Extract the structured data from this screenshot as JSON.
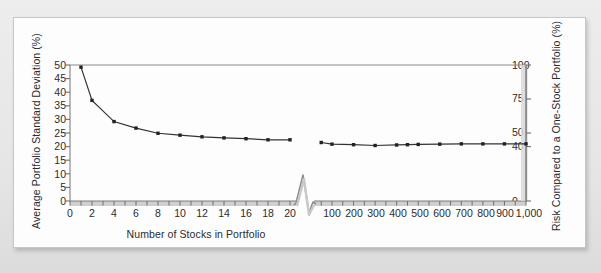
{
  "figure": {
    "kind": "scanned-textbook-figure",
    "background_color": "#eaeaea",
    "panel_color": "#fdfdfd"
  },
  "chart_data": {
    "type": "line",
    "title": "",
    "subtitle": "",
    "xlabel": "Number of Stocks in Portfolio",
    "ylabel": "Average Portfolio Standard Deviation (%)",
    "y2label": "Risk Compared to a One-Stock Portfolio (%)",
    "grid": false,
    "legend": false,
    "axis_break": {
      "present": true,
      "after_category": "20",
      "before_category": "100",
      "style": "zigzag"
    },
    "xlim_segment_1": [
      0,
      20
    ],
    "xlim_segment_2": [
      0,
      1000
    ],
    "ylim": [
      0,
      50
    ],
    "y2lim": [
      0,
      100
    ],
    "xticks_segment_1": [
      "0",
      "2",
      "4",
      "6",
      "8",
      "10",
      "12",
      "14",
      "16",
      "18",
      "20"
    ],
    "xticks_segment_2": [
      "100",
      "200",
      "300",
      "400",
      "500",
      "600",
      "700",
      "800",
      "900",
      "1,000"
    ],
    "yticks": [
      "0",
      "5",
      "10",
      "15",
      "20",
      "25",
      "30",
      "35",
      "40",
      "45",
      "50"
    ],
    "y2ticks": [
      "0",
      "40",
      "50",
      "75",
      "100"
    ],
    "series": [
      {
        "name": "Average portfolio standard deviation",
        "marker": "square",
        "color": "#333333",
        "segment_1": {
          "x": [
            1,
            2,
            4,
            6,
            8,
            10,
            12,
            14,
            16,
            18,
            20
          ],
          "y": [
            49.2,
            37.0,
            29.2,
            26.8,
            24.9,
            24.2,
            23.6,
            23.2,
            22.9,
            22.5,
            22.5
          ]
        },
        "segment_2": {
          "x": [
            50,
            100,
            200,
            300,
            400,
            450,
            500,
            600,
            700,
            800,
            900,
            1000
          ],
          "y": [
            21.5,
            20.9,
            20.7,
            20.4,
            20.6,
            20.7,
            20.8,
            20.9,
            21.0,
            21.0,
            21.0,
            21.0
          ]
        }
      }
    ],
    "annotations": [],
    "reading": {
      "one_stock_risk_percent": 100,
      "large_portfolio_risk_percent": 40
    }
  },
  "axis_labels": {
    "left_title": "Average Portfolio Standard Deviation (%)",
    "right_title": "Risk Compared to a One-Stock Portfolio (%)",
    "bottom_title": "Number of Stocks in Portfolio"
  },
  "y_ticks_left": [
    {
      "label": "50",
      "value": 50
    },
    {
      "label": "45",
      "value": 45
    },
    {
      "label": "40",
      "value": 40
    },
    {
      "label": "35",
      "value": 35
    },
    {
      "label": "30",
      "value": 30
    },
    {
      "label": "25",
      "value": 25
    },
    {
      "label": "20",
      "value": 20
    },
    {
      "label": "15",
      "value": 15
    },
    {
      "label": "10",
      "value": 10
    },
    {
      "label": "5",
      "value": 5
    },
    {
      "label": "0",
      "value": 0
    }
  ],
  "y_ticks_right": [
    {
      "label": "100",
      "value": 100
    },
    {
      "label": "75",
      "value": 75
    },
    {
      "label": "50",
      "value": 50
    },
    {
      "label": "40",
      "value": 40
    },
    {
      "label": "0",
      "value": 0
    }
  ],
  "x_ticks_left": [
    {
      "label": "0",
      "value": 0
    },
    {
      "label": "2",
      "value": 2
    },
    {
      "label": "4",
      "value": 4
    },
    {
      "label": "6",
      "value": 6
    },
    {
      "label": "8",
      "value": 8
    },
    {
      "label": "10",
      "value": 10
    },
    {
      "label": "12",
      "value": 12
    },
    {
      "label": "14",
      "value": 14
    },
    {
      "label": "16",
      "value": 16
    },
    {
      "label": "18",
      "value": 18
    },
    {
      "label": "20",
      "value": 20
    }
  ],
  "x_ticks_right": [
    {
      "label": "100",
      "value": 100
    },
    {
      "label": "200",
      "value": 200
    },
    {
      "label": "300",
      "value": 300
    },
    {
      "label": "400",
      "value": 400
    },
    {
      "label": "500",
      "value": 500
    },
    {
      "label": "600",
      "value": 600
    },
    {
      "label": "700",
      "value": 700
    },
    {
      "label": "800",
      "value": 800
    },
    {
      "label": "900",
      "value": 900
    },
    {
      "label": "1,000",
      "value": 1000
    }
  ],
  "colors": {
    "line": "#3a3a3a",
    "marker": "#222222",
    "axis": "#8a8a8a",
    "text": "#2b2b2b",
    "panel": "#fdfdfd",
    "backdrop": "#eaeaea"
  }
}
